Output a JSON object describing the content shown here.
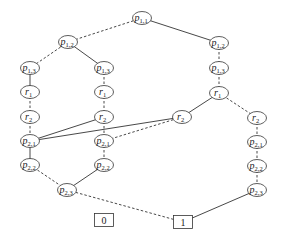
{
  "diagram": {
    "type": "binary-decision-diagram",
    "nodes": [
      {
        "id": "n0",
        "var": "p",
        "sub": "1,1",
        "x": 142,
        "y": 18
      },
      {
        "id": "n1",
        "var": "p",
        "sub": "1,2",
        "x": 68,
        "y": 42
      },
      {
        "id": "n2",
        "var": "p",
        "sub": "1,2",
        "x": 219,
        "y": 43
      },
      {
        "id": "n3",
        "var": "p",
        "sub": "1,3",
        "x": 30,
        "y": 68
      },
      {
        "id": "n4",
        "var": "p",
        "sub": "1,3",
        "x": 104,
        "y": 68
      },
      {
        "id": "n5",
        "var": "p",
        "sub": "1,3",
        "x": 219,
        "y": 68
      },
      {
        "id": "n6",
        "var": "r",
        "sub": "1",
        "x": 30,
        "y": 92
      },
      {
        "id": "n7",
        "var": "r",
        "sub": "1",
        "x": 104,
        "y": 92
      },
      {
        "id": "n8",
        "var": "r",
        "sub": "1",
        "x": 219,
        "y": 93
      },
      {
        "id": "n9",
        "var": "r",
        "sub": "2",
        "x": 30,
        "y": 117
      },
      {
        "id": "n10",
        "var": "r",
        "sub": "2",
        "x": 104,
        "y": 117
      },
      {
        "id": "n11",
        "var": "r",
        "sub": "2",
        "x": 182,
        "y": 117
      },
      {
        "id": "n12",
        "var": "r",
        "sub": "2",
        "x": 257,
        "y": 118
      },
      {
        "id": "n13",
        "var": "p",
        "sub": "2,1",
        "x": 30,
        "y": 141
      },
      {
        "id": "n14",
        "var": "p",
        "sub": "2,1",
        "x": 104,
        "y": 141
      },
      {
        "id": "n15",
        "var": "p",
        "sub": "2,1",
        "x": 257,
        "y": 142
      },
      {
        "id": "n16",
        "var": "p",
        "sub": "2,2",
        "x": 30,
        "y": 165
      },
      {
        "id": "n17",
        "var": "p",
        "sub": "2,2",
        "x": 104,
        "y": 165
      },
      {
        "id": "n18",
        "var": "p",
        "sub": "2,2",
        "x": 257,
        "y": 166
      },
      {
        "id": "n19",
        "var": "p",
        "sub": "2,3",
        "x": 67,
        "y": 190
      },
      {
        "id": "n20",
        "var": "p",
        "sub": "2,3",
        "x": 257,
        "y": 190
      }
    ],
    "terminals": [
      {
        "id": "t0",
        "label": "0",
        "x": 104,
        "y": 220
      },
      {
        "id": "t1",
        "label": "1",
        "x": 183,
        "y": 222
      }
    ],
    "edges": [
      {
        "from": "n0",
        "to": "n1",
        "style": "dashed"
      },
      {
        "from": "n0",
        "to": "n2",
        "style": "solid"
      },
      {
        "from": "n1",
        "to": "n3",
        "style": "dashed"
      },
      {
        "from": "n1",
        "to": "n4",
        "style": "solid"
      },
      {
        "from": "n2",
        "to": "n5",
        "style": "dashed"
      },
      {
        "from": "n3",
        "to": "n6",
        "style": "solid"
      },
      {
        "from": "n4",
        "to": "n7",
        "style": "dashed"
      },
      {
        "from": "n5",
        "to": "n8",
        "style": "dashed"
      },
      {
        "from": "n6",
        "to": "n9",
        "style": "dashed"
      },
      {
        "from": "n7",
        "to": "n10",
        "style": "dashed"
      },
      {
        "from": "n8",
        "to": "n11",
        "style": "solid"
      },
      {
        "from": "n8",
        "to": "n12",
        "style": "dashed"
      },
      {
        "from": "n9",
        "to": "n13",
        "style": "dashed"
      },
      {
        "from": "n10",
        "to": "n13",
        "style": "solid"
      },
      {
        "from": "n10",
        "to": "n14",
        "style": "dashed"
      },
      {
        "from": "n11",
        "to": "n13",
        "style": "solid"
      },
      {
        "from": "n11",
        "to": "n14",
        "style": "dashed"
      },
      {
        "from": "n12",
        "to": "n15",
        "style": "dashed"
      },
      {
        "from": "n13",
        "to": "n16",
        "style": "solid"
      },
      {
        "from": "n14",
        "to": "n17",
        "style": "dashed"
      },
      {
        "from": "n15",
        "to": "n18",
        "style": "dashed"
      },
      {
        "from": "n16",
        "to": "n19",
        "style": "dashed"
      },
      {
        "from": "n17",
        "to": "n19",
        "style": "solid"
      },
      {
        "from": "n18",
        "to": "n20",
        "style": "dashed"
      },
      {
        "from": "n19",
        "to": "t1",
        "style": "dashed"
      },
      {
        "from": "n20",
        "to": "t1",
        "style": "solid"
      }
    ]
  }
}
